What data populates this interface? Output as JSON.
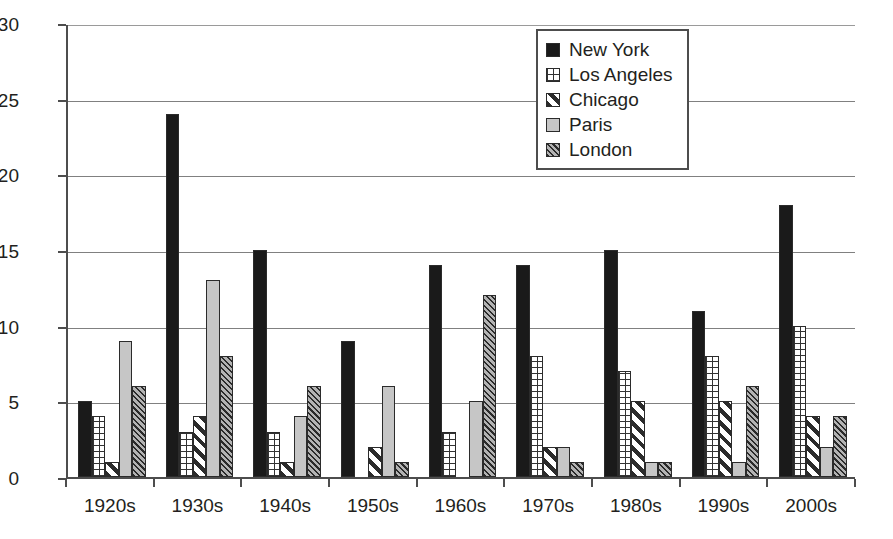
{
  "chart_data": {
    "type": "bar",
    "title": "",
    "xlabel": "",
    "ylabel": "",
    "ylim": [
      0,
      30
    ],
    "yticks": [
      0,
      5,
      10,
      15,
      20,
      25,
      30
    ],
    "grid": true,
    "legend_position": "top-right",
    "categories": [
      "1920s",
      "1930s",
      "1940s",
      "1950s",
      "1960s",
      "1970s",
      "1980s",
      "1990s",
      "2000s"
    ],
    "series": [
      {
        "name": "New York",
        "pattern": "solid-black",
        "color": "#1a1a1a",
        "values": [
          5,
          24,
          15,
          9,
          14,
          14,
          15,
          11,
          18
        ]
      },
      {
        "name": "Los Angeles",
        "pattern": "grid",
        "color": "#ffffff",
        "values": [
          4,
          3,
          3,
          0,
          3,
          8,
          7,
          8,
          10
        ]
      },
      {
        "name": "Chicago",
        "pattern": "diagonal-stripes",
        "color": "#ffffff",
        "values": [
          1,
          4,
          1,
          2,
          0,
          2,
          5,
          5,
          4
        ]
      },
      {
        "name": "Paris",
        "pattern": "solid-gray",
        "color": "#c6c6c6",
        "values": [
          9,
          13,
          4,
          6,
          5,
          2,
          1,
          1,
          2
        ]
      },
      {
        "name": "London",
        "pattern": "dense-diagonal-hatch",
        "color": "#b3b3b3",
        "values": [
          6,
          8,
          6,
          1,
          12,
          1,
          1,
          6,
          4
        ]
      }
    ]
  },
  "legend": {
    "items": [
      {
        "label": "New York"
      },
      {
        "label": "Los Angeles"
      },
      {
        "label": "Chicago"
      },
      {
        "label": "Paris"
      },
      {
        "label": "London"
      }
    ]
  },
  "axes": {
    "y_tick_labels": [
      "0",
      "5",
      "10",
      "15",
      "20",
      "25",
      "30"
    ],
    "x_tick_labels": [
      "1920s",
      "1930s",
      "1940s",
      "1950s",
      "1960s",
      "1970s",
      "1980s",
      "1990s",
      "2000s"
    ]
  }
}
